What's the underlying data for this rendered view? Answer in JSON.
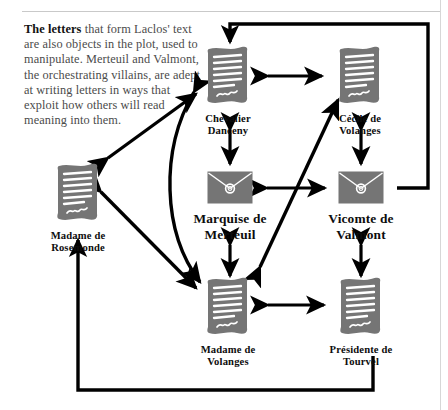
{
  "figure": {
    "title": "The letters that form Laclos' text are also objects in the plot",
    "background_color": "#ffffff",
    "icon_color": "#757575",
    "arrow_color": "#000000"
  },
  "annotation": {
    "lead": "The letters",
    "body": " that form Laclos' text are also objects in the plot, used to manipulate. Merteuil and Valmont, the orchestrating villains, are adept at writing letters in ways that exploit how others will read meaning into them."
  },
  "nodes": [
    {
      "id": "chevalier-danceny",
      "label": "Chevalier\nDanceny",
      "icon": "letter-sheet-icon",
      "x": 228,
      "y": 48,
      "size": "normal"
    },
    {
      "id": "cecile-de-volanges",
      "label": "Cécile de\nVolanges",
      "icon": "letter-sheet-icon",
      "x": 360,
      "y": 48,
      "size": "normal"
    },
    {
      "id": "marquise-de-merteuil",
      "label": "Marquise de\nMerteuil",
      "icon": "sealed-envelope-icon",
      "x": 230,
      "y": 171,
      "size": "big"
    },
    {
      "id": "vicomte-de-valmont",
      "label": "Vicomte de\nValmont",
      "icon": "sealed-envelope-icon",
      "x": 361,
      "y": 171,
      "size": "big"
    },
    {
      "id": "madame-de-rosemonde",
      "label": "Madame de\nRosemonde",
      "icon": "letter-sheet-icon",
      "x": 78,
      "y": 165,
      "size": "normal"
    },
    {
      "id": "madame-de-volanges",
      "label": "Madame de\nVolanges",
      "icon": "letter-sheet-icon",
      "x": 228,
      "y": 279,
      "size": "normal"
    },
    {
      "id": "presidente-de-tourvel",
      "label": "Présidente de\nTourvel",
      "icon": "letter-sheet-icon",
      "x": 361,
      "y": 279,
      "size": "normal"
    }
  ],
  "edges": [
    {
      "id": "danceny-cecile",
      "from": "chevalier-danceny",
      "to": "cecile-de-volanges",
      "style": "double-straight"
    },
    {
      "id": "danceny-merteuil",
      "from": "chevalier-danceny",
      "to": "marquise-de-merteuil",
      "style": "double-straight"
    },
    {
      "id": "cecile-valmont",
      "from": "cecile-de-volanges",
      "to": "vicomte-de-valmont",
      "style": "double-straight"
    },
    {
      "id": "merteuil-valmont",
      "from": "marquise-de-merteuil",
      "to": "vicomte-de-valmont",
      "style": "double-straight"
    },
    {
      "id": "merteuil-mme-volanges",
      "from": "marquise-de-merteuil",
      "to": "madame-de-volanges",
      "style": "double-straight"
    },
    {
      "id": "valmont-tourvel",
      "from": "vicomte-de-valmont",
      "to": "presidente-de-tourvel",
      "style": "double-straight"
    },
    {
      "id": "mme-volanges-tourvel",
      "from": "madame-de-volanges",
      "to": "presidente-de-tourvel",
      "style": "double-straight"
    },
    {
      "id": "rosemonde-danceny",
      "from": "madame-de-rosemonde",
      "to": "chevalier-danceny",
      "style": "double-diagonal"
    },
    {
      "id": "rosemonde-mme-volanges",
      "from": "madame-de-rosemonde",
      "to": "madame-de-volanges",
      "style": "double-diagonal"
    },
    {
      "id": "cecile-mme-volanges",
      "from": "cecile-de-volanges",
      "to": "madame-de-volanges",
      "style": "double-diagonal"
    },
    {
      "id": "danceny-mme-volanges-curve",
      "from": "chevalier-danceny",
      "to": "madame-de-volanges",
      "style": "double-curved"
    },
    {
      "id": "valmont-danceny-loop",
      "from": "vicomte-de-valmont",
      "to": "chevalier-danceny",
      "style": "single-orthogonal-top"
    },
    {
      "id": "rosemonde-tourvel-loop",
      "from": "presidente-de-tourvel",
      "to": "madame-de-rosemonde",
      "style": "single-orthogonal-bottom"
    }
  ]
}
